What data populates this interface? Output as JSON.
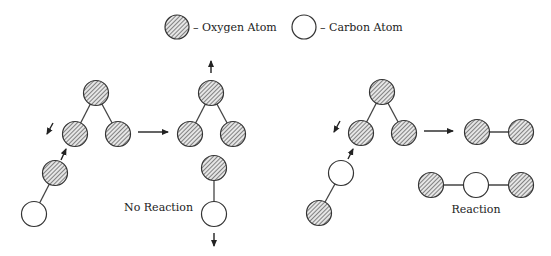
{
  "legend": {
    "oxygen_label": "– Oxygen Atom",
    "carbon_label": "– Carbon Atom"
  },
  "panels": [
    {
      "name": "ozone-plus-oxygen-carbon",
      "result_label": "No Reaction"
    },
    {
      "name": "ozone-plus-carbon-oxygen",
      "result_label": "Reaction"
    }
  ],
  "colors": {
    "oxygen_fill": "#9a9a9a",
    "carbon_fill": "#ffffff",
    "stroke": "#333333"
  }
}
